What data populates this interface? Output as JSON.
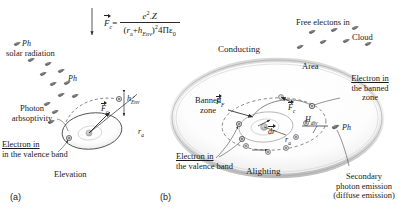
{
  "figure": {
    "caption_a": "(a)",
    "caption_b": "(b)"
  },
  "formula": {
    "lhs": "F",
    "lhs_sub": "c",
    "equals": "=",
    "numerator_e": "e",
    "numerator_exp": "2",
    "numerator_dot": ".",
    "numerator_Z": "Z",
    "den_open": "(",
    "den_ra": "r",
    "den_ra_sub": "a",
    "den_plus": "+",
    "den_h": "h",
    "den_h_sub": "Env",
    "den_close": ")",
    "den_exp": "2",
    "den_tail": "4Πε",
    "den_tail_sub": "0"
  },
  "panel_a": {
    "photon_label_top": "Ph",
    "solar_radiation": "solar radiation",
    "photon_label_mid": "Ph",
    "photon_absorptivity_line1": "Photon",
    "photon_absorptivity_line2": "arbsoptivity",
    "electron_valence_line1": "Electron in",
    "electron_valence_line2": "in the valence band",
    "elevation": "Elevation",
    "h_env": "h",
    "h_env_sub": "Env",
    "r_a": "r",
    "r_a_sub": "a",
    "force_c": "F",
    "force_c_sub": "c"
  },
  "panel_b": {
    "free_electrons": "Free electons in",
    "cloud": "Cloud",
    "conducting": "Conducting",
    "area": "Area",
    "electron_banned_line1": "Electron in",
    "electron_banned_line2": "the banned",
    "electron_banned_line3": "zone",
    "banned_zone_line1": "Banned",
    "banned_zone_line2": "zone",
    "electron_valence_line1": "Electron in",
    "electron_valence_line2": "the valence band",
    "alighting": "Alighting",
    "photon_label": "Ph",
    "secondary_line1": "Secondary",
    "secondary_line2": "photon emission",
    "secondary_line3": "(diffuse emission)",
    "force_f": "F",
    "force_f_sub": "F",
    "force_c": "F",
    "force_c_sub": "c",
    "h_div": "H",
    "h_div_sub": "div",
    "dr": "dr",
    "r_a": "r",
    "r_a_sub": "a"
  },
  "colors": {
    "ink": "#1a1a1a",
    "line": "#3a3a3a",
    "shell_light": "#e3e3e3",
    "shell_mid": "#c9c9c9",
    "particle": "#6b6b6b",
    "particle_dark": "#4a4a4a"
  }
}
